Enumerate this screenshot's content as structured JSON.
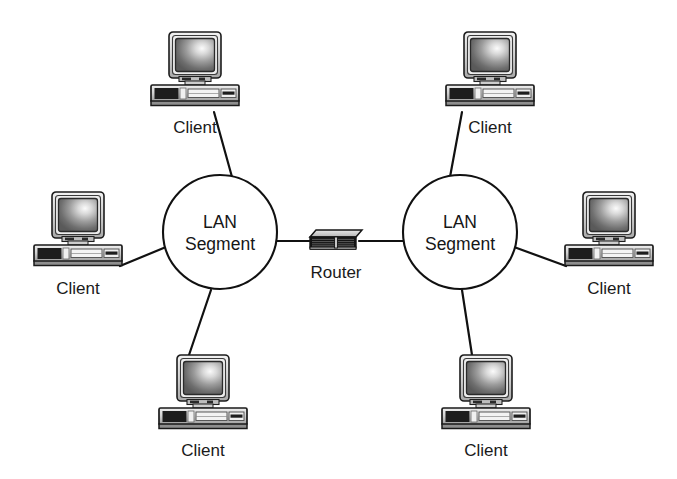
{
  "diagram": {
    "background_color": "#ffffff",
    "line_color": "#111111",
    "text_color": "#161616",
    "width": 677,
    "height": 479,
    "segments": [
      {
        "id": "lan-segment-left",
        "label_line1": "LAN",
        "label_line2": "Segment",
        "cx": 220,
        "cy": 232,
        "r": 57
      },
      {
        "id": "lan-segment-right",
        "label_line1": "LAN",
        "label_line2": "Segment",
        "cx": 460,
        "cy": 232,
        "r": 57
      }
    ],
    "router": {
      "id": "router",
      "label": "Router",
      "cx": 336,
      "cy": 240,
      "label_x": 336,
      "label_y": 274
    },
    "clients": [
      {
        "id": "client-top-left",
        "label": "Client",
        "x": 195,
        "y": 72,
        "label_x": 195,
        "label_y": 128,
        "line": {
          "x1": 214,
          "y1": 112,
          "x2": 232,
          "y2": 177
        }
      },
      {
        "id": "client-left",
        "label": "Client",
        "x": 78,
        "y": 232,
        "label_x": 78,
        "label_y": 290,
        "line": {
          "x1": 120,
          "y1": 268,
          "x2": 166,
          "y2": 248
        }
      },
      {
        "id": "client-bottom-left",
        "label": "Client",
        "x": 203,
        "y": 395,
        "label_x": 203,
        "label_y": 452,
        "line": {
          "x1": 189,
          "y1": 355,
          "x2": 211,
          "y2": 290
        }
      },
      {
        "id": "client-top-right",
        "label": "Client",
        "x": 490,
        "y": 72,
        "label_x": 490,
        "label_y": 128,
        "line": {
          "x1": 462,
          "y1": 112,
          "x2": 450,
          "y2": 177
        }
      },
      {
        "id": "client-right",
        "label": "Client",
        "x": 609,
        "y": 232,
        "label_x": 609,
        "label_y": 290,
        "line": {
          "x1": 566,
          "y1": 268,
          "x2": 514,
          "y2": 248
        }
      },
      {
        "id": "client-bottom-right",
        "label": "Client",
        "x": 486,
        "y": 395,
        "label_x": 486,
        "label_y": 452,
        "line": {
          "x1": 472,
          "y1": 355,
          "x2": 462,
          "y2": 290
        }
      }
    ],
    "backbone_links": [
      {
        "id": "link-left-router",
        "x1": 277,
        "y1": 241,
        "x2": 311,
        "y2": 241
      },
      {
        "id": "link-router-right",
        "x1": 361,
        "y1": 241,
        "x2": 403,
        "y2": 241
      }
    ]
  }
}
